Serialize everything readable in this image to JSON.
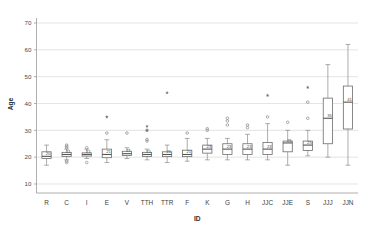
{
  "chart_data": {
    "type": "box",
    "title": "",
    "xlabel": "ID",
    "ylabel": "Age",
    "ylim": [
      7,
      73
    ],
    "yticks": [
      10,
      20,
      30,
      40,
      50,
      60,
      70
    ],
    "ytick_labels": [
      "10",
      "20",
      "30",
      "40",
      "50",
      "60",
      "70"
    ],
    "grid": "horizontal",
    "legend": "none",
    "categories": [
      "R",
      "C",
      "I",
      "E",
      "V",
      "TTH",
      "TTR",
      "F",
      "K",
      "G",
      "H",
      "JJC",
      "JJE",
      "S",
      "JJJ",
      "JJN"
    ],
    "boxes": [
      {
        "category": "R",
        "whisker_low": 17.0,
        "q1": 19.5,
        "median": 20.3,
        "q3": 22.0,
        "whisker_high": 24.5,
        "median_label": "20",
        "outliers_circle": [],
        "outliers_star": []
      },
      {
        "category": "C",
        "whisker_low": 19.0,
        "q1": 20.3,
        "median": 21.0,
        "q3": 21.8,
        "whisker_high": 23.0,
        "median_label": "21",
        "outliers_circle": [
          18.0,
          18.5,
          23.5,
          24.0,
          24.5
        ],
        "outliers_star": []
      },
      {
        "category": "I",
        "whisker_low": 19.5,
        "q1": 20.4,
        "median": 21.0,
        "q3": 21.6,
        "whisker_high": 23.0,
        "median_label": "21",
        "outliers_circle": [
          18.0,
          23.5
        ],
        "outliers_star": []
      },
      {
        "category": "E",
        "whisker_low": 18.0,
        "q1": 19.8,
        "median": 21.0,
        "q3": 23.0,
        "whisker_high": 26.5,
        "median_label": "21",
        "outliers_circle": [
          29.0
        ],
        "outliers_star": [
          35.0
        ]
      },
      {
        "category": "V",
        "whisker_low": 19.5,
        "q1": 20.6,
        "median": 21.3,
        "q3": 22.2,
        "whisker_high": 23.5,
        "median_label": "21",
        "outliers_circle": [
          29.0
        ],
        "outliers_star": []
      },
      {
        "category": "TTH",
        "whisker_low": 19.0,
        "q1": 20.3,
        "median": 21.0,
        "q3": 21.8,
        "whisker_high": 23.0,
        "median_label": "21",
        "outliers_circle": [
          26.0,
          26.6,
          30.0
        ],
        "outliers_star": [
          30.0,
          31.5
        ]
      },
      {
        "category": "TTR",
        "whisker_low": 18.0,
        "q1": 20.2,
        "median": 21.0,
        "q3": 22.0,
        "whisker_high": 24.5,
        "median_label": "21",
        "outliers_circle": [],
        "outliers_star": [
          44.0
        ]
      },
      {
        "category": "F",
        "whisker_low": 18.5,
        "q1": 20.2,
        "median": 21.0,
        "q3": 22.6,
        "whisker_high": 27.0,
        "median_label": "21",
        "outliers_circle": [
          29.0
        ],
        "outliers_star": []
      },
      {
        "category": "K",
        "whisker_low": 19.0,
        "q1": 21.5,
        "median": 23.0,
        "q3": 24.5,
        "whisker_high": 27.0,
        "median_label": "23",
        "outliers_circle": [
          30.0,
          30.6
        ],
        "outliers_star": []
      },
      {
        "category": "G",
        "whisker_low": 19.0,
        "q1": 21.0,
        "median": 23.0,
        "q3": 25.0,
        "whisker_high": 27.0,
        "median_label": "23",
        "outliers_circle": [
          32.0,
          33.5,
          34.5
        ],
        "outliers_star": []
      },
      {
        "category": "H",
        "whisker_low": 19.0,
        "q1": 21.0,
        "median": 23.0,
        "q3": 25.0,
        "whisker_high": 28.5,
        "median_label": "23",
        "outliers_circle": [
          31.0,
          32.0
        ],
        "outliers_star": []
      },
      {
        "category": "JJC",
        "whisker_low": 19.0,
        "q1": 21.0,
        "median": 23.0,
        "q3": 25.5,
        "whisker_high": 32.5,
        "median_label": "23",
        "outliers_circle": [
          35.0
        ],
        "outliers_star": [
          43.0
        ]
      },
      {
        "category": "JJE",
        "whisker_low": 17.0,
        "q1": 22.0,
        "median": 25.3,
        "q3": 26.0,
        "whisker_high": 30.0,
        "median_label": "25",
        "outliers_circle": [
          33.0
        ],
        "outliers_star": []
      },
      {
        "category": "S",
        "whisker_low": 20.5,
        "q1": 22.5,
        "median": 24.5,
        "q3": 26.0,
        "whisker_high": 30.0,
        "median_label": "25",
        "outliers_circle": [
          34.5,
          40.5
        ],
        "outliers_star": [
          46.0
        ]
      },
      {
        "category": "JJJ",
        "whisker_low": 20.0,
        "q1": 25.0,
        "median": 34.5,
        "q3": 42.0,
        "whisker_high": 54.5,
        "median_label": "35",
        "outliers_circle": [],
        "outliers_star": []
      },
      {
        "category": "JJN",
        "whisker_low": 17.0,
        "q1": 30.5,
        "median": 40.5,
        "q3": 46.5,
        "whisker_high": 62.0,
        "median_label": "41",
        "outliers_circle": [],
        "outliers_star": []
      }
    ]
  },
  "axes": {
    "x_title": "ID",
    "y_title": "Age"
  },
  "colors": {
    "grid": "#d9d9d9",
    "box_stroke": "#6b6b6b",
    "median": "#555555",
    "whisker": "#8a8a8a",
    "marker": "#6f6f6f",
    "background": "#ffffff"
  }
}
